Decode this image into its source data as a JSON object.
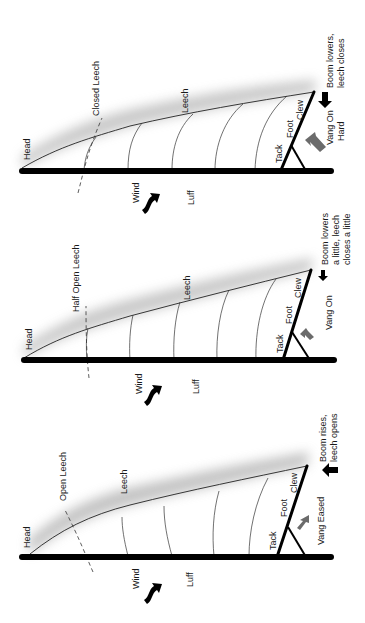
{
  "diagram": {
    "colors": {
      "mast": "#000000",
      "vang_arrow": "#6b6b6b",
      "shadow": "#9a9a9a",
      "background": "#ffffff"
    },
    "panels": [
      {
        "id": "vang-on-hard",
        "head": "Head",
        "leech_state": "Closed Leech",
        "leech": "Leech",
        "luff": "Luff",
        "wind": "Wind",
        "tack": "Tack",
        "foot": "Foot",
        "clew": "Clew",
        "vang_line1": "Vang On",
        "vang_line2": "Hard",
        "effect_line1": "Boom lowers,",
        "effect_line2": "leech closes",
        "effect_line3": "",
        "boom_arrow": "right"
      },
      {
        "id": "vang-on",
        "head": "Head",
        "leech_state": "Half Open Leech",
        "leech": "Leech",
        "luff": "Luff",
        "wind": "Wind",
        "tack": "Tack",
        "foot": "Foot",
        "clew": "Clew",
        "vang_line1": "Vang On",
        "vang_line2": "",
        "effect_line1": "Boom lowers",
        "effect_line2": "a little, leech",
        "effect_line3": "closes a little",
        "boom_arrow": "right"
      },
      {
        "id": "vang-eased",
        "head": "Head",
        "leech_state": "Open Leech",
        "leech": "Leech",
        "luff": "Luff",
        "wind": "Wind",
        "tack": "Tack",
        "foot": "Foot",
        "clew": "Clew",
        "vang_line1": "Vang Eased",
        "vang_line2": "",
        "effect_line1": "Boom rises,",
        "effect_line2": "leech opens",
        "effect_line3": "",
        "boom_arrow": "left"
      }
    ]
  }
}
